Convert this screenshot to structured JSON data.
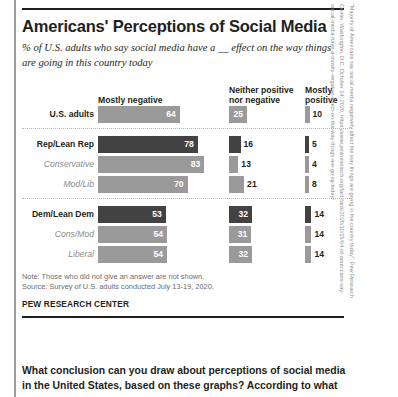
{
  "infographic": {
    "title": "Americans' Perceptions of Social Media",
    "subtitle": "% of U.S. adults who say social media have a __ effect on the way things are going in this country today",
    "headers": {
      "mostly_negative": "Mostly negative",
      "neither": "Neither positive\nnor negative",
      "mostly_positive": "Mostly\npositive"
    },
    "notes": {
      "note": "Note: Those who did not give an answer are not shown.",
      "source": "Source: Survey of U.S. adults conducted July 13-19, 2020."
    },
    "brand": "PEW RESEARCH CENTER",
    "citation": "“Majority of Americans say social media negatively affect the way things are going in the country today”, Pew Research Center, Washington, D.C. October 14, 2020, https://www.pewresearch.org/fact-tank/2020/10/15/64-of-americans-say-social-media-have-a-mostly-negative-effect-on-the-way-things-are-going-today/"
  },
  "question": {
    "text": "What conclusion can you draw about perceptions of social media in the United States, based on these graphs? According to what"
  },
  "colors": {
    "dark_bar": "#424242",
    "light_bar": "#9a9a9a",
    "text": "#231f20",
    "sub_label": "#8a8a8a",
    "note": "#6d6d6d"
  },
  "chart_data": {
    "type": "bar",
    "title": "Americans' Perceptions of Social Media",
    "subtitle": "% of U.S. adults who say social media have a __ effect on the way things are going in this country today",
    "xlabel": "",
    "ylabel": "",
    "xlim": [
      0,
      100
    ],
    "grid": false,
    "legend_position": "top-as-column-headers",
    "categories": [
      "Mostly negative",
      "Neither positive nor negative",
      "Mostly positive"
    ],
    "groups": [
      {
        "name": "total",
        "rows": [
          {
            "label": "U.S. adults",
            "emphasis": "main",
            "shade": "light",
            "values": {
              "mostly_negative": 64,
              "neither": 25,
              "mostly_positive": 10
            }
          }
        ]
      },
      {
        "name": "republican",
        "rows": [
          {
            "label": "Rep/Lean Rep",
            "emphasis": "main",
            "shade": "dark",
            "values": {
              "mostly_negative": 78,
              "neither": 16,
              "mostly_positive": 5
            }
          },
          {
            "label": "Conservative",
            "emphasis": "sub",
            "shade": "light",
            "values": {
              "mostly_negative": 83,
              "neither": 13,
              "mostly_positive": 4
            }
          },
          {
            "label": "Mod/Lib",
            "emphasis": "sub",
            "shade": "light",
            "values": {
              "mostly_negative": 70,
              "neither": 21,
              "mostly_positive": 8
            }
          }
        ]
      },
      {
        "name": "democrat",
        "rows": [
          {
            "label": "Dem/Lean Dem",
            "emphasis": "main",
            "shade": "dark",
            "values": {
              "mostly_negative": 53,
              "neither": 32,
              "mostly_positive": 14
            }
          },
          {
            "label": "Cons/Mod",
            "emphasis": "sub",
            "shade": "light",
            "values": {
              "mostly_negative": 54,
              "neither": 31,
              "mostly_positive": 14
            }
          },
          {
            "label": "Liberal",
            "emphasis": "sub",
            "shade": "light",
            "values": {
              "mostly_negative": 54,
              "neither": 32,
              "mostly_positive": 14
            }
          }
        ]
      }
    ]
  }
}
